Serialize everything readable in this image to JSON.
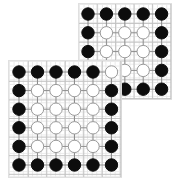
{
  "figure": {
    "width": 182,
    "height": 184,
    "background_color": "#ffffff",
    "grid_line_color": "#e9e9e9",
    "edge_color": "#8c8c8c",
    "major_line_color": "#c2c2c2",
    "node_fill_black": "#0d0d0d",
    "node_fill_white": "#ffffff",
    "node_stroke_white": "#9a9a9a"
  },
  "panels": [
    {
      "name": "top-right-lattice",
      "rows": 5,
      "cols": 5,
      "x": 78,
      "y": 3,
      "width": 94,
      "height": 97,
      "spacing_x": 18.4,
      "spacing_y": 18.8,
      "margin_x": 10,
      "margin_y": 11,
      "node_radius": 6.2,
      "nodes": [
        [
          "black",
          "black",
          "black",
          "black",
          "black"
        ],
        [
          "black",
          "white",
          "white",
          "white",
          "black"
        ],
        [
          "black",
          "white",
          "white",
          "white",
          "black"
        ],
        [
          "black",
          "white",
          "white",
          "white",
          "black"
        ],
        [
          "white",
          "black",
          "black",
          "black",
          "black"
        ]
      ]
    },
    {
      "name": "bottom-left-lattice",
      "rows": 6,
      "cols": 6,
      "x": 8,
      "y": 60,
      "width": 114,
      "height": 118,
      "spacing_x": 18.5,
      "spacing_y": 18.6,
      "margin_x": 11,
      "margin_y": 12,
      "node_radius": 6.2,
      "nodes": [
        [
          "black",
          "black",
          "black",
          "black",
          "black",
          "white"
        ],
        [
          "black",
          "white",
          "white",
          "white",
          "white",
          "black"
        ],
        [
          "black",
          "white",
          "white",
          "white",
          "white",
          "black"
        ],
        [
          "black",
          "white",
          "white",
          "white",
          "white",
          "black"
        ],
        [
          "black",
          "white",
          "white",
          "white",
          "white",
          "black"
        ],
        [
          "black",
          "black",
          "black",
          "black",
          "black",
          "black"
        ]
      ]
    }
  ]
}
